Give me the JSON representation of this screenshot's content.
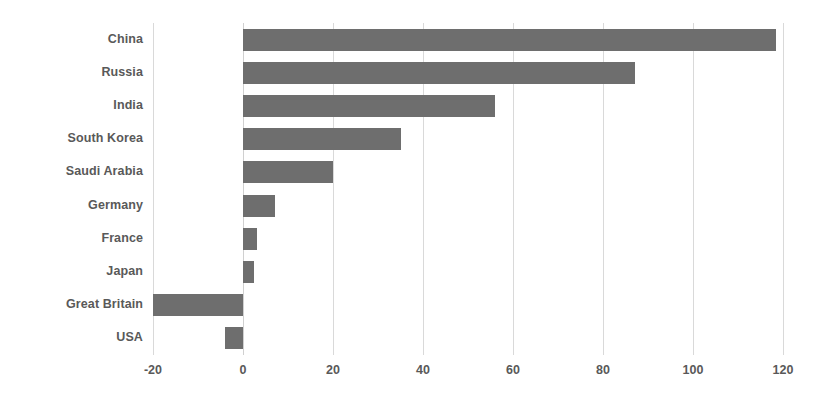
{
  "chart_data": {
    "type": "bar",
    "orientation": "horizontal",
    "title": "",
    "subtitle": "",
    "xlabel": "",
    "ylabel": "",
    "categories": [
      "China",
      "Russia",
      "India",
      "South Korea",
      "Saudi Arabia",
      "Germany",
      "France",
      "Japan",
      "Great Britain",
      "USA"
    ],
    "values": [
      118.5,
      87,
      56,
      35,
      20,
      7,
      3,
      2.5,
      -20,
      -4
    ],
    "series": [
      {
        "name": "",
        "values": [
          118.5,
          87,
          56,
          35,
          20,
          7,
          3,
          2.5,
          -20,
          -4
        ]
      }
    ],
    "xlim": [
      -20,
      120
    ],
    "xticks": [
      -20,
      0,
      20,
      40,
      60,
      80,
      100,
      120
    ],
    "xtick_labels": [
      "-20",
      "0",
      "20",
      "40",
      "60",
      "80",
      "100",
      "120"
    ],
    "grid": "vertical",
    "legend": "none",
    "bar_color": "#6e6e6e",
    "gridline_color": "#d9d9d9",
    "label_color": "#595959",
    "background": "#ffffff"
  }
}
